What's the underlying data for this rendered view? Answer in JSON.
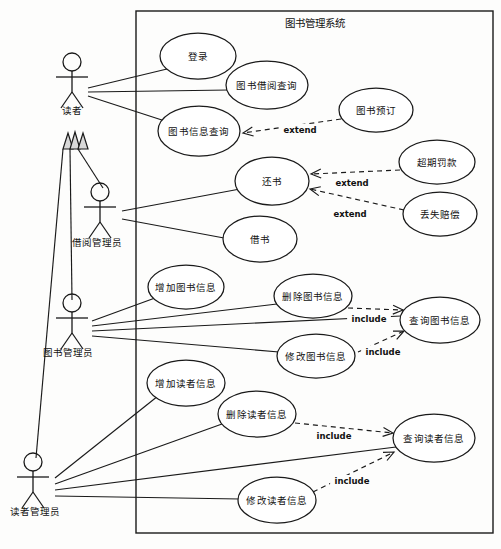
{
  "diagram": {
    "kind": "uml-use-case-diagram",
    "system_boundary": {
      "title": "图书管理系统",
      "x": 136,
      "y": 11,
      "width": 357,
      "height": 522
    },
    "canvas": {
      "width": 501,
      "height": 549,
      "background": "#fdfdfc"
    },
    "stroke_color": "#1a1a1a",
    "fill_color": "#ffffff"
  },
  "actors": [
    {
      "id": "reader",
      "label": "读者",
      "x": 72,
      "y": 62,
      "label_x": 72,
      "label_y": 110
    },
    {
      "id": "loan-admin",
      "label": "借阅管理员",
      "x": 100,
      "y": 192,
      "label_x": 97,
      "label_y": 242
    },
    {
      "id": "book-admin",
      "label": "图书管理员",
      "x": 72,
      "y": 303,
      "label_x": 68,
      "label_y": 352
    },
    {
      "id": "reader-admin",
      "label": "读者管理员",
      "x": 33,
      "y": 462,
      "label_x": 35,
      "label_y": 511
    }
  ],
  "use_cases": [
    {
      "id": "login",
      "label": "登录",
      "cx": 198,
      "cy": 56,
      "rx": 38,
      "ry": 23
    },
    {
      "id": "loan-query",
      "label": "图书借阅查询",
      "cx": 267,
      "cy": 85,
      "rx": 41,
      "ry": 24
    },
    {
      "id": "book-info-query",
      "label": "图书信息查询",
      "cx": 199,
      "cy": 131,
      "rx": 41,
      "ry": 25
    },
    {
      "id": "book-reserve",
      "label": "图书预订",
      "cx": 376,
      "cy": 110,
      "rx": 37,
      "ry": 22
    },
    {
      "id": "return-book",
      "label": "还书",
      "cx": 272,
      "cy": 181,
      "rx": 37,
      "ry": 24
    },
    {
      "id": "overdue-fine",
      "label": "超期罚款",
      "cx": 437,
      "cy": 162,
      "rx": 38,
      "ry": 22
    },
    {
      "id": "lost-compensate",
      "label": "丢失赔偿",
      "cx": 440,
      "cy": 214,
      "rx": 37,
      "ry": 22
    },
    {
      "id": "borrow-book",
      "label": "借书",
      "cx": 260,
      "cy": 239,
      "rx": 37,
      "ry": 23
    },
    {
      "id": "add-book",
      "label": "增加图书信息",
      "cx": 186,
      "cy": 287,
      "rx": 38,
      "ry": 22
    },
    {
      "id": "del-book",
      "label": "删除图书信息",
      "cx": 313,
      "cy": 296,
      "rx": 39,
      "ry": 22
    },
    {
      "id": "query-book",
      "label": "查询图书信息",
      "cx": 440,
      "cy": 320,
      "rx": 40,
      "ry": 23
    },
    {
      "id": "edit-book",
      "label": "修改图书信息",
      "cx": 316,
      "cy": 356,
      "rx": 39,
      "ry": 22
    },
    {
      "id": "add-reader",
      "label": "增加读者信息",
      "cx": 186,
      "cy": 383,
      "rx": 39,
      "ry": 23
    },
    {
      "id": "del-reader",
      "label": "删除读者信息",
      "cx": 257,
      "cy": 414,
      "rx": 39,
      "ry": 23
    },
    {
      "id": "query-reader",
      "label": "查询读者信息",
      "cx": 434,
      "cy": 438,
      "rx": 41,
      "ry": 24
    },
    {
      "id": "edit-reader",
      "label": "修改读者信息",
      "cx": 277,
      "cy": 500,
      "rx": 39,
      "ry": 23
    }
  ],
  "associations": [
    {
      "from": "reader",
      "to": "login",
      "x1": 88,
      "y1": 88,
      "x2": 167,
      "y2": 69
    },
    {
      "from": "reader",
      "to": "loan-query",
      "x1": 88,
      "y1": 92,
      "x2": 229,
      "y2": 90
    },
    {
      "from": "reader",
      "to": "book-info-query",
      "x1": 88,
      "y1": 96,
      "x2": 168,
      "y2": 122
    },
    {
      "from": "loan-admin",
      "to": "return-book",
      "x1": 122,
      "y1": 211,
      "x2": 240,
      "y2": 189
    },
    {
      "from": "loan-admin",
      "to": "borrow-book",
      "x1": 122,
      "y1": 219,
      "x2": 224,
      "y2": 238
    },
    {
      "from": "book-admin",
      "to": "add-book",
      "x1": 92,
      "y1": 321,
      "x2": 155,
      "y2": 298
    },
    {
      "from": "book-admin",
      "to": "del-book",
      "x1": 92,
      "y1": 326,
      "x2": 277,
      "y2": 304
    },
    {
      "from": "book-admin",
      "to": "query-book",
      "x1": 92,
      "y1": 331,
      "x2": 401,
      "y2": 316
    },
    {
      "from": "book-admin",
      "to": "edit-book",
      "x1": 92,
      "y1": 336,
      "x2": 279,
      "y2": 352
    },
    {
      "from": "reader-admin",
      "to": "add-reader",
      "x1": 55,
      "y1": 478,
      "x2": 158,
      "y2": 396
    },
    {
      "from": "reader-admin",
      "to": "del-reader",
      "x1": 55,
      "y1": 484,
      "x2": 222,
      "y2": 424
    },
    {
      "from": "reader-admin",
      "to": "query-reader",
      "x1": 55,
      "y1": 490,
      "x2": 396,
      "y2": 447
    },
    {
      "from": "reader-admin",
      "to": "edit-reader",
      "x1": 55,
      "y1": 496,
      "x2": 240,
      "y2": 499
    }
  ],
  "generalizations": [
    {
      "from": "loan-admin",
      "to": "reader",
      "label": ""
    },
    {
      "from": "book-admin",
      "to": "reader",
      "label": ""
    },
    {
      "from": "reader-admin",
      "to": "reader",
      "label": ""
    }
  ],
  "dependencies": [
    {
      "id": "dep-reserve-extend",
      "from": "book-reserve",
      "to": "book-info-query",
      "stereotype": "extend",
      "label_x": 300,
      "label_y": 130,
      "x1": 341,
      "y1": 119,
      "x2": 243,
      "y2": 133
    },
    {
      "id": "dep-fine-extend",
      "from": "overdue-fine",
      "to": "return-book",
      "stereotype": "extend",
      "label_x": 352,
      "label_y": 183,
      "x1": 400,
      "y1": 170,
      "x2": 311,
      "y2": 174
    },
    {
      "id": "dep-lost-extend",
      "from": "lost-compensate",
      "to": "return-book",
      "stereotype": "extend",
      "label_x": 350,
      "label_y": 214,
      "x1": 404,
      "y1": 210,
      "x2": 310,
      "y2": 189
    },
    {
      "id": "dep-delbook-incl",
      "from": "del-book",
      "to": "query-book",
      "stereotype": "include",
      "label_x": 369,
      "label_y": 319,
      "x1": 348,
      "y1": 308,
      "x2": 403,
      "y2": 310
    },
    {
      "id": "dep-editbook-incl",
      "from": "edit-book",
      "to": "query-book",
      "stereotype": "include",
      "label_x": 383,
      "label_y": 352,
      "x1": 358,
      "y1": 352,
      "x2": 404,
      "y2": 331
    },
    {
      "id": "dep-delreader-incl",
      "from": "del-reader",
      "to": "query-reader",
      "stereotype": "include",
      "label_x": 334,
      "label_y": 436,
      "x1": 295,
      "y1": 423,
      "x2": 393,
      "y2": 433
    },
    {
      "id": "dep-editreader-incl",
      "from": "edit-reader",
      "to": "query-reader",
      "stereotype": "include",
      "label_x": 352,
      "label_y": 481,
      "x1": 313,
      "y1": 492,
      "x2": 394,
      "y2": 452
    }
  ]
}
